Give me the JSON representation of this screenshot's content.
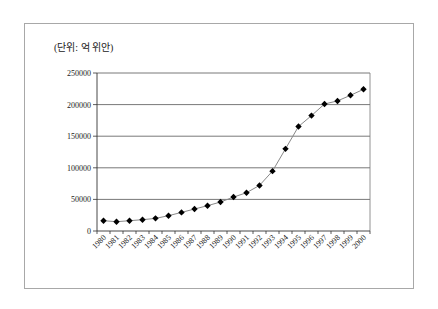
{
  "chart_data": {
    "type": "line",
    "title": "",
    "unit_label": "(단위: 억 위안)",
    "xlabel": "",
    "ylabel": "",
    "ylim": [
      0,
      250000
    ],
    "yticks": [
      0,
      50000,
      100000,
      150000,
      200000,
      250000
    ],
    "grid": true,
    "legend": "none",
    "marker": "diamond",
    "categories": [
      "1980",
      "1981",
      "1982",
      "1983",
      "1984",
      "1985",
      "1986",
      "1987",
      "1988",
      "1989",
      "1990",
      "1991",
      "1992",
      "1993",
      "1994",
      "1995",
      "1996",
      "1997",
      "1998",
      "1999",
      "2000"
    ],
    "series": [
      {
        "name": "",
        "values": [
          16300,
          14700,
          16300,
          17900,
          20000,
          24200,
          29400,
          34800,
          40000,
          45900,
          53700,
          60600,
          72100,
          94700,
          130000,
          165300,
          182600,
          201000,
          205800,
          214700,
          224200
        ]
      }
    ]
  }
}
